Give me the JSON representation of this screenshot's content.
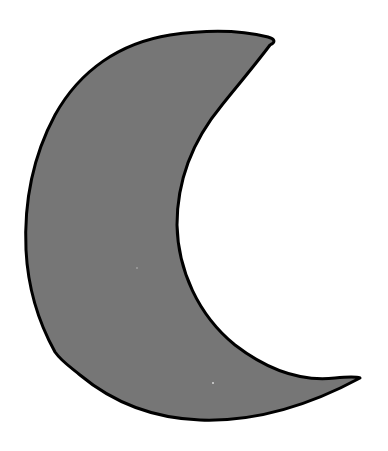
{
  "image": {
    "subject": "crescent moon",
    "label": "Crescent moon shape",
    "width": 388,
    "height": 451
  },
  "colors": {
    "background": "#ffffff",
    "fill": "#767676",
    "outline": "#000000"
  },
  "shape": {
    "icon": "crescent-moon-icon",
    "outline_width": 3,
    "path": "M 270 45 C 276 42, 275 39, 268 37 C 240 30, 205 30, 170 35 C 120 43, 80 70, 55 115 C 32 158, 24 205, 26 250 C 28 290, 40 325, 55 352 C 62 362, 72 368, 80 375 C 110 400, 150 418, 200 420 C 255 422, 310 405, 360 378 C 355 376, 345 377, 335 378 C 300 382, 265 368, 235 345 C 198 315, 178 270, 177 225 C 177 180, 193 140, 222 105 C 238 85, 255 65, 270 45 Z",
    "speck_1": {
      "x": 213,
      "y": 383
    },
    "speck_2": {
      "x": 137,
      "y": 268
    }
  }
}
